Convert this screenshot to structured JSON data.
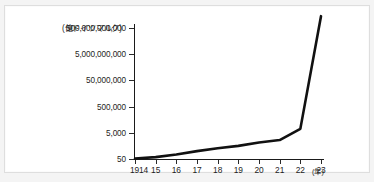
{
  "figure": {
    "background_color": "#f4f4f4",
    "panel_color": "#ffffff",
    "frame_color": "#dedede",
    "line_color": "#111111"
  },
  "chart_data": {
    "type": "line",
    "title": "",
    "subtitle": "",
    "xlabel": "(年)",
    "ylabel": "(億ドイツマルク)",
    "yscale": "log",
    "grid": false,
    "legend": "none",
    "x": [
      1914,
      1915,
      1916,
      1917,
      1918,
      1919,
      1920,
      1921,
      1922,
      1923
    ],
    "x_tick_labels": [
      "1914",
      "15",
      "16",
      "17",
      "18",
      "19",
      "20",
      "21",
      "22",
      "23"
    ],
    "x_axis_unit_label": "(年)",
    "y_unit_label": "(億ドイツマルク)",
    "y_tick_labels": [
      "500,000,000,000",
      "5,000,000,000",
      "50,000,000",
      "500,000",
      "5,000",
      "50"
    ],
    "y_tick_values": [
      500000000000,
      5000000000,
      50000000,
      500000,
      5000,
      50
    ],
    "ylim": [
      50,
      5000000000000
    ],
    "series": [
      {
        "name": "ドイツの通貨流通量",
        "values": [
          55,
          70,
          110,
          200,
          330,
          500,
          900,
          1400,
          10000,
          4000000000000
        ]
      }
    ]
  },
  "accessibility": {
    "description": "対数目盛の折れ線グラフ。1914年から1923年にかけてのドイツのハイパーインフレーション。"
  }
}
